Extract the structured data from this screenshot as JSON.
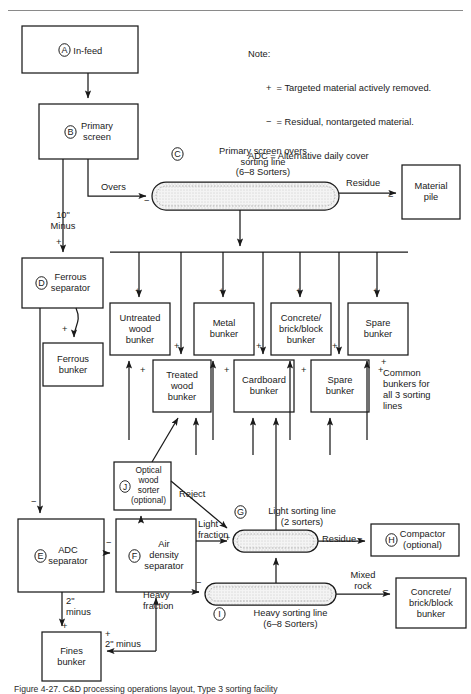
{
  "figure": {
    "caption": "Figure 4-27. C&D processing operations layout, Type 3 sorting facility",
    "note_title": "Note:",
    "note_lines": [
      "+  = Targeted material actively removed.",
      "−  = Residual, nontargeted material.",
      "ADC = Alternative daily cover"
    ],
    "plus": "+",
    "minus": "−"
  },
  "nodes": {
    "A": {
      "key": "A",
      "label": "In-feed",
      "x": 22,
      "y": 26,
      "w": 116,
      "h": 47
    },
    "B": {
      "key": "B",
      "label": "Primary\nscreen",
      "x": 39,
      "y": 104,
      "w": 99,
      "h": 55
    },
    "C": {
      "key": "C",
      "title": "Primary screen overs\nsorting line\n(6–8 Sorters)",
      "x": 152,
      "y": 182,
      "w": 187,
      "h": 28
    },
    "D": {
      "key": "D",
      "label": "Ferrous\nseparator",
      "x": 22,
      "y": 258,
      "w": 81,
      "h": 50
    },
    "E": {
      "key": "E",
      "label": "ADC\nseparator",
      "x": 18,
      "y": 519,
      "w": 86,
      "h": 73
    },
    "F": {
      "key": "F",
      "label": "Air\ndensity\nseparator",
      "x": 116,
      "y": 519,
      "w": 80,
      "h": 73
    },
    "G": {
      "key": "G",
      "title": "Light sorting line\n(2 sorters)",
      "x": 233,
      "y": 530,
      "w": 85,
      "h": 22
    },
    "H": {
      "key": "H",
      "label": "Compactor\n(optional)",
      "x": 371,
      "y": 524,
      "w": 88,
      "h": 32
    },
    "I": {
      "key": "I",
      "title": "Heavy sorting line\n(6–8 Sorters)",
      "x": 205,
      "y": 583,
      "w": 131,
      "h": 22
    },
    "J": {
      "key": "J",
      "label": "Optical\nwood\nsorter\n(optional)",
      "x": 114,
      "y": 462,
      "w": 57,
      "h": 48
    }
  },
  "boxes": {
    "material_pile": {
      "label": "Material\npile",
      "x": 402,
      "y": 165,
      "w": 58,
      "h": 54
    },
    "ferrous_bunker": {
      "label": "Ferrous\nbunker",
      "x": 43,
      "y": 343,
      "w": 60,
      "h": 43
    },
    "fines_bunker": {
      "label": "Fines\nbunker",
      "x": 42,
      "y": 632,
      "w": 59,
      "h": 49
    },
    "concrete_bunker_bottom": {
      "label": "Concrete/\nbrick/block\nbunker",
      "x": 396,
      "y": 578,
      "w": 70,
      "h": 50
    }
  },
  "bunkers_top": [
    {
      "name": "untreated-wood-bunker",
      "label": "Untreated\nwood\nbunker",
      "x": 110,
      "y": 303,
      "w": 60,
      "h": 52
    },
    {
      "name": "metal-bunker",
      "label": "Metal\nbunker",
      "x": 194,
      "y": 303,
      "w": 60,
      "h": 52
    },
    {
      "name": "concrete-brick-block-bunker",
      "label": "Concrete/\nbrick/block\nbunker",
      "x": 271,
      "y": 303,
      "w": 60,
      "h": 52
    },
    {
      "name": "spare-bunker",
      "label": "Spare\nbunker",
      "x": 348,
      "y": 303,
      "w": 60,
      "h": 52
    }
  ],
  "bunkers_bottom": [
    {
      "name": "treated-wood-bunker",
      "label": "Treated\nwood\nbunker",
      "x": 153,
      "y": 360,
      "w": 58,
      "h": 52
    },
    {
      "name": "cardboard-bunker",
      "label": "Cardboard\nbunker",
      "x": 234,
      "y": 360,
      "w": 60,
      "h": 52
    },
    {
      "name": "spare-bunker-2",
      "label": "Spare\nbunker",
      "x": 311,
      "y": 360,
      "w": 58,
      "h": 52
    }
  ],
  "edge_labels": {
    "overs": "Overs",
    "residue_top": "Residue",
    "ten_inch_minus": "10\"\nMinus",
    "reject": "Reject",
    "light_fraction": "Light\nfraction",
    "heavy_fraction": "Heavy\nfraction",
    "residue_light": "Residue",
    "mixed_rock": "Mixed\nrock",
    "two_inch_minus_a": "2\"\nminus",
    "two_inch_minus_b": "2\" minus",
    "common_bunkers": "Common\nbunkers for\nall 3 sorting\nlines"
  },
  "colors": {
    "stroke": "#1a1a1a",
    "fill": "#ffffff",
    "conveyor_fill": "#f2f2f2",
    "rule": "#8a8a8a"
  }
}
